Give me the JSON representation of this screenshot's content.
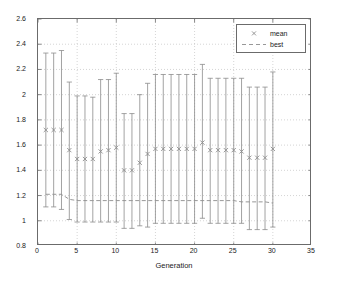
{
  "chart_data": {
    "type": "scatter",
    "title": "",
    "xlabel": "Generation",
    "ylabel": "Dispertion",
    "xlim": [
      0,
      35
    ],
    "ylim": [
      0.8,
      2.6
    ],
    "xticks": [
      0,
      5,
      10,
      15,
      20,
      25,
      30,
      35
    ],
    "xtick_labels": [
      "0",
      "5",
      "10",
      "15",
      "20",
      "25",
      "30",
      "35"
    ],
    "yticks": [
      0.8,
      1,
      1.2,
      1.4,
      1.6,
      1.8,
      2,
      2.2,
      2.4,
      2.6
    ],
    "ytick_labels": [
      "0.8",
      "1",
      "1.2",
      "1.4",
      "1.6",
      "1.8",
      "2",
      "2.2",
      "2.4",
      "2.6"
    ],
    "grid": "dotted",
    "legend_position": "top-right",
    "legend": [
      {
        "label": "mean",
        "marker": "x",
        "linestyle": "none",
        "color": "#8c8c8c"
      },
      {
        "label": "best",
        "marker": "none",
        "linestyle": "dashed",
        "color": "#8c8c8c"
      }
    ],
    "x": [
      1,
      2,
      3,
      4,
      5,
      6,
      7,
      8,
      9,
      10,
      11,
      12,
      13,
      14,
      15,
      16,
      17,
      18,
      19,
      20,
      21,
      22,
      23,
      24,
      25,
      26,
      27,
      28,
      29,
      30
    ],
    "series": [
      {
        "name": "mean",
        "marker": "x",
        "values": [
          1.72,
          1.72,
          1.72,
          1.56,
          1.49,
          1.49,
          1.49,
          1.55,
          1.56,
          1.58,
          1.4,
          1.4,
          1.46,
          1.53,
          1.57,
          1.57,
          1.57,
          1.57,
          1.57,
          1.57,
          1.62,
          1.56,
          1.56,
          1.56,
          1.56,
          1.55,
          1.5,
          1.5,
          1.5,
          1.57
        ],
        "err_upper": [
          2.33,
          2.33,
          2.35,
          2.1,
          1.99,
          1.99,
          1.98,
          2.12,
          2.12,
          2.17,
          1.85,
          1.85,
          2.0,
          2.09,
          2.16,
          2.16,
          2.16,
          2.16,
          2.16,
          2.16,
          2.24,
          2.13,
          2.13,
          2.13,
          2.13,
          2.13,
          2.06,
          2.06,
          2.06,
          2.18
        ],
        "err_lower": [
          1.11,
          1.11,
          1.09,
          1.01,
          0.99,
          0.99,
          0.99,
          0.99,
          0.99,
          0.99,
          0.94,
          0.94,
          0.96,
          0.95,
          0.98,
          0.98,
          0.98,
          0.98,
          0.98,
          0.98,
          1.02,
          0.98,
          0.98,
          0.98,
          0.98,
          0.98,
          0.93,
          0.93,
          0.93,
          0.95
        ]
      },
      {
        "name": "best",
        "linestyle": "dashed",
        "values": [
          1.21,
          1.21,
          1.21,
          1.17,
          1.16,
          1.16,
          1.16,
          1.16,
          1.16,
          1.16,
          1.16,
          1.16,
          1.16,
          1.16,
          1.16,
          1.16,
          1.16,
          1.16,
          1.16,
          1.16,
          1.16,
          1.16,
          1.16,
          1.16,
          1.16,
          1.15,
          1.15,
          1.15,
          1.15,
          1.14
        ]
      }
    ]
  }
}
